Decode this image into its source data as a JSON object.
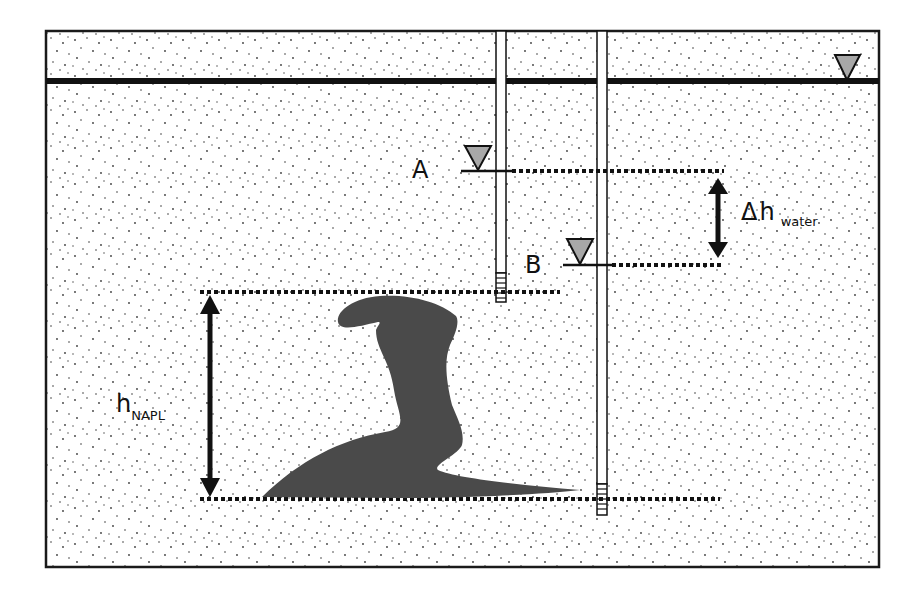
{
  "diagram": {
    "labels": {
      "well_a": "A",
      "well_b": "B",
      "delta_symbol": "Δ",
      "delta_h": "h",
      "delta_h_subscript": "water",
      "h_napl": "h",
      "h_napl_subscript": "NAPL"
    },
    "elements": {
      "water_table_symbol": "water-table-triangle",
      "well_a_level_symbol": "water-level-triangle",
      "well_b_level_symbol": "water-level-triangle",
      "napl_body": "dark-gray-napl-plume",
      "wells": [
        "well-a",
        "well-b"
      ]
    },
    "colors": {
      "frame": "#1a1a1a",
      "background": "#ffffff",
      "sand_dots": "#3a3a3a",
      "napl": "#4a4a4a",
      "triangle_fill": "#a8a8a8",
      "lines": "#111111"
    }
  }
}
